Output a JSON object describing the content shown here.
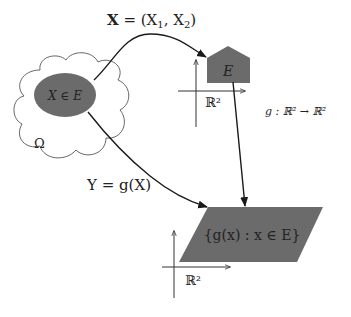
{
  "diagram": {
    "top_arrow_label": "X = (X₁, X₂)",
    "top_arrow_label_parts": {
      "bold": "X",
      "rest": " = (X",
      "sub1": "1",
      "mid": ", X",
      "sub2": "2",
      "end": ")"
    },
    "random_element_label": "X ∈ E",
    "sample_space_label": "Ω",
    "set_label": "E",
    "space_label_top": "ℝ²",
    "function_label": "g : ℝ² → ℝ²",
    "bottom_arrow_label": "Y = g(X)",
    "image_set_label": "{g(x) : x ∈ E}",
    "space_label_bottom": "ℝ²",
    "colors": {
      "fill_dark": "#6b6b6b",
      "stroke": "#1a1a1a",
      "cloud_stroke": "#555555",
      "axis": "#333333"
    }
  }
}
